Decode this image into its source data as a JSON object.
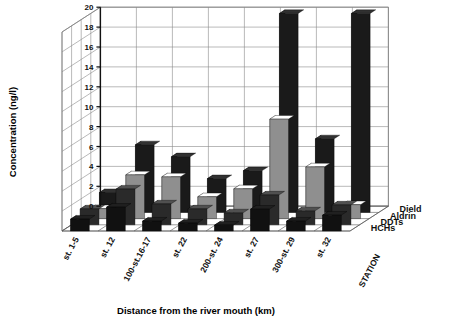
{
  "chart_data": {
    "type": "bar",
    "title": "",
    "xlabel": "Distance from the river mouth (km)",
    "ylabel": "Concentration (ng/l)",
    "zlabel": "STATION",
    "ylim": [
      0,
      20
    ],
    "yticks": [
      0,
      2,
      4,
      6,
      8,
      10,
      12,
      14,
      16,
      18,
      20
    ],
    "ytick_labels": [
      "0",
      "2",
      "4",
      "6",
      "8",
      "10",
      "12",
      "14",
      "16",
      "18",
      "20"
    ],
    "grid": true,
    "legend_position": "right-bottom",
    "categories": [
      "st. 1-5",
      "st. 12",
      "100-st.16-17",
      "st. 22",
      "200-st. 24",
      "st. 27",
      "300-st. 29",
      "st. 32"
    ],
    "series": [
      {
        "name": "HCHs",
        "color": "#111111",
        "values": [
          1.2,
          2.4,
          1.0,
          0.8,
          0.6,
          2.2,
          1.0,
          1.6
        ]
      },
      {
        "name": "DDTs",
        "color": "#2a2a2a",
        "values": [
          1.6,
          3.6,
          2.1,
          1.6,
          1.2,
          3.0,
          1.4,
          2.0
        ]
      },
      {
        "name": "Aldrin",
        "color": "#8f8f8f",
        "values": [
          1.0,
          4.4,
          4.2,
          2.2,
          3.0,
          10.0,
          5.2,
          1.4
        ]
      },
      {
        "name": "Dield",
        "color": "#1a1a1a",
        "values": [
          2.0,
          6.8,
          5.6,
          3.4,
          4.2,
          20.0,
          7.4,
          20.0
        ]
      }
    ]
  },
  "legend": {
    "entries": [
      "Dield",
      "Aldrin",
      "DDTs",
      "HCHs"
    ]
  },
  "axes": {
    "y_title": "Concentration (ng/l)",
    "x_title": "Distance from the river mouth (km)",
    "z_title": "STATION"
  }
}
